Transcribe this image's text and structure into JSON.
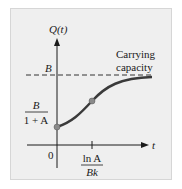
{
  "diagram": {
    "y_axis_label": "Q(t)",
    "x_axis_label": "t",
    "origin_label": "0",
    "asymptote_label": "B",
    "asymptote_annotation": [
      "Carrying",
      "capacity"
    ],
    "initial_value_label": {
      "numerator": "B",
      "denominator": "1 + A"
    },
    "inflection_time_label": {
      "numerator": "ln A",
      "denominator": "Bk"
    },
    "colors": {
      "background": "#efefef",
      "curve": "#3a3a3a",
      "point": "#8a8a8a",
      "axis": "#1a1a1a"
    }
  }
}
